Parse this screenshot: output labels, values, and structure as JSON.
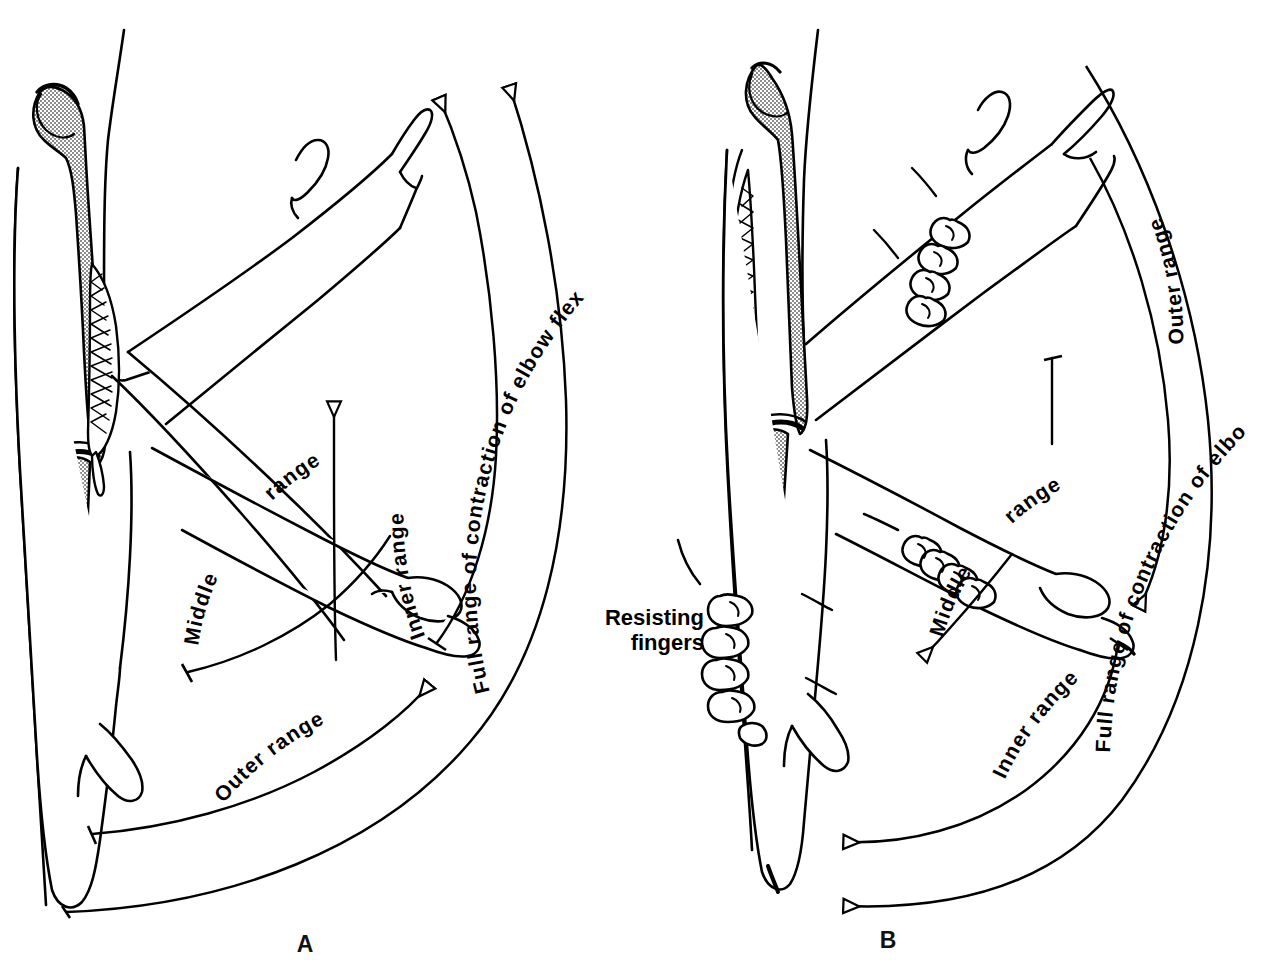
{
  "figure": {
    "background_color": "#ffffff",
    "ink_color": "#000000",
    "bone_shading_color": "#999999",
    "panel_count": 2
  },
  "panels": [
    {
      "id": "A",
      "letter": "A",
      "subject": "elbow-flexors",
      "full_range_label": "Full range of contraction of elbow flexors",
      "ranges": [
        {
          "name": "inner",
          "label": "Inner range"
        },
        {
          "name": "middle",
          "label_part1": "Middle",
          "label_part2": "range",
          "label": "Middle range"
        },
        {
          "name": "outer",
          "label": "Outer range"
        }
      ],
      "arrow_count": 5,
      "arrow_direction": "counterclockwise-up",
      "anatomy": {
        "bone_upper": "humerus",
        "bone_lower": "radius-ulna",
        "muscle": "biceps-brachii",
        "muscle_side": "anterior",
        "hand": "open-hand-thumb"
      }
    },
    {
      "id": "B",
      "letter": "B",
      "subject": "elbow-extensors",
      "full_range_label": "Full range of contraction of elbow extensors",
      "resisting_label_line1": "Resisting",
      "resisting_label_line2": "fingers",
      "ranges": [
        {
          "name": "outer",
          "label": "Outer range"
        },
        {
          "name": "middle",
          "label_part1": "Middle",
          "label_part2": "range",
          "label": "Middle range"
        },
        {
          "name": "inner",
          "label": "Inner range"
        }
      ],
      "arrow_count": 4,
      "arrow_direction": "clockwise-down",
      "anatomy": {
        "bone_upper": "humerus",
        "bone_lower": "radius-ulna",
        "muscle": "triceps-brachii",
        "muscle_side": "posterior",
        "hand": "open-hand-thumb"
      }
    }
  ]
}
